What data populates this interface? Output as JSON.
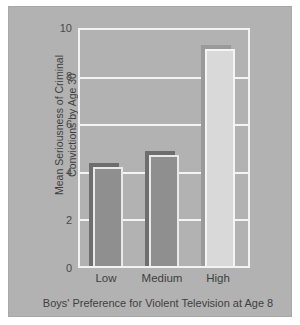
{
  "chart_data": {
    "type": "bar",
    "title": "",
    "categories": [
      "Low",
      "Medium",
      "High"
    ],
    "values": [
      4.2,
      4.7,
      9.2
    ],
    "series": [
      {
        "name": "Mean Seriousness of Criminal Convictions by Age 30",
        "values": [
          4.2,
          4.7,
          9.2
        ]
      }
    ],
    "xlabel": "Boys' Preference for Violent Television at Age 8",
    "ylabel": "Mean Seriousness of Criminal\nConvictions by Age 30",
    "ylabel_line1": "Mean Seriousness of Criminal",
    "ylabel_line2": "Convictions by Age 30",
    "ylim": [
      0,
      10
    ],
    "yticks": [
      0,
      2,
      4,
      6,
      8,
      10
    ],
    "ytick_labels": [
      "0",
      "2",
      "4",
      "6",
      "8",
      "10"
    ],
    "grid": true,
    "grid_axis": "y",
    "legend": false,
    "legend_position": "none",
    "bar_colors": [
      "#8f8f8f",
      "#8f8f8f",
      "#d9d9d9"
    ],
    "colors": {
      "background": "#b2b2b2",
      "page": "#ffffff",
      "gridline": "#f4f4f4",
      "frame": "#f2f2f2",
      "bar_dark": "#8f8f8f",
      "bar_light": "#d9d9d9",
      "text": "#3f3f3f"
    }
  }
}
